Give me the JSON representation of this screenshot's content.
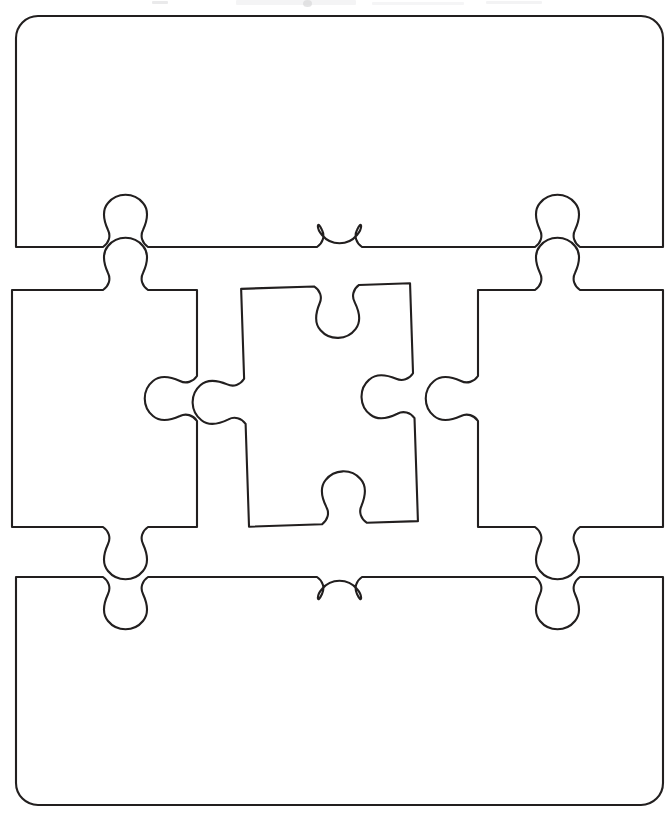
{
  "document": {
    "title": "Blank Jigsaw Puzzle Piece Template",
    "kind": "worksheet",
    "orientation": "portrait",
    "page_width": 670,
    "page_height": 820,
    "background_color": "#ffffff",
    "outline_color": "#221f1f",
    "fill_color": "#ffffff",
    "stroke_width": 2.1
  },
  "layout": {
    "rows": 3,
    "columns_middle_row": 3,
    "total_pieces": 5,
    "description": "Five blank interlocking jigsaw pieces: one wide banner piece on top, three standard pieces across the middle, one wide banner piece on the bottom."
  },
  "pieces": [
    {
      "id": "top-banner",
      "label": "Top banner piece",
      "row": 1,
      "column": 1,
      "shape": "wide-rounded-banner",
      "corners": "rounded-top",
      "corner_radius": 22,
      "bounds": {
        "x": 16,
        "y": 16,
        "width": 647,
        "height": 232
      },
      "edges": {
        "top": "flat-rounded",
        "left": "flat",
        "right": "flat",
        "bottom": "three-blanks"
      },
      "connector_count": 3
    },
    {
      "id": "middle-left",
      "label": "Middle left piece",
      "row": 2,
      "column": 1,
      "shape": "standard-square",
      "rotation_deg": 0,
      "bounds": {
        "x": 12,
        "y": 288,
        "width": 186,
        "height": 240
      },
      "edges": {
        "top": "tab-up",
        "left": "flat",
        "right": "blank-left",
        "bottom": "tab-down"
      },
      "connector_count": 3
    },
    {
      "id": "middle-center",
      "label": "Middle center piece",
      "row": 2,
      "column": 2,
      "shape": "standard-square",
      "rotation_deg": -1.8,
      "bounds": {
        "x": 238,
        "y": 278,
        "width": 182,
        "height": 252
      },
      "edges": {
        "top": "blank-down",
        "left": "tab-left",
        "right": "blank-left",
        "bottom": "blank-up"
      },
      "connector_count": 4
    },
    {
      "id": "middle-right",
      "label": "Middle right piece",
      "row": 2,
      "column": 3,
      "shape": "standard-square",
      "rotation_deg": 0,
      "bounds": {
        "x": 478,
        "y": 288,
        "width": 185,
        "height": 240
      },
      "edges": {
        "top": "tab-up",
        "left": "tab-left",
        "right": "flat",
        "bottom": "tab-down"
      },
      "connector_count": 3
    },
    {
      "id": "bottom-banner",
      "label": "Bottom banner piece",
      "row": 3,
      "column": 1,
      "shape": "wide-rounded-banner",
      "corners": "rounded-bottom",
      "corner_radius": 22,
      "bounds": {
        "x": 16,
        "y": 575,
        "width": 647,
        "height": 230
      },
      "edges": {
        "top": "three-blanks",
        "left": "flat",
        "right": "flat",
        "bottom": "flat-rounded"
      },
      "connector_count": 3
    }
  ],
  "connectors": [
    {
      "id": "top-left-joint",
      "direction": "up",
      "x": 126,
      "between": [
        "top-banner",
        "middle-left"
      ]
    },
    {
      "id": "top-center-joint",
      "direction": "down",
      "x": 340,
      "between": [
        "top-banner",
        "middle-center"
      ]
    },
    {
      "id": "top-right-joint",
      "direction": "up",
      "x": 558,
      "between": [
        "top-banner",
        "middle-right"
      ]
    },
    {
      "id": "left-center-joint",
      "direction": "left",
      "y": 398,
      "between": [
        "middle-left",
        "middle-center"
      ]
    },
    {
      "id": "center-right-joint",
      "direction": "left",
      "y": 398,
      "between": [
        "middle-center",
        "middle-right"
      ]
    },
    {
      "id": "bottom-left-joint",
      "direction": "down",
      "x": 126,
      "between": [
        "middle-left",
        "bottom-banner"
      ]
    },
    {
      "id": "bottom-center-joint",
      "direction": "up",
      "x": 340,
      "between": [
        "middle-center",
        "bottom-banner"
      ]
    },
    {
      "id": "bottom-right-joint",
      "direction": "down",
      "x": 558,
      "between": [
        "middle-right",
        "bottom-banner"
      ]
    }
  ],
  "artifacts": {
    "present": true,
    "description": "Faint grey scanner residue clipped along the very top edge of the page."
  }
}
